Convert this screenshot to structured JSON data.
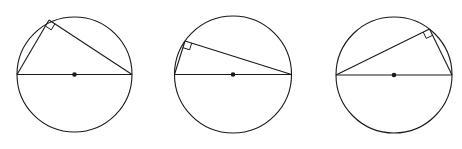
{
  "diagram": {
    "title": "",
    "stroke_color": "#1a1a1a",
    "background": "#ffffff",
    "figures": [
      {
        "id": "figure-1",
        "center": [
          74.5,
          74.5
        ],
        "radius": 57.5,
        "diameter_endpoints": [
          [
            17,
            74.5
          ],
          [
            132,
            74.5
          ]
        ],
        "right_angle_vertex": [
          49,
          20
        ],
        "right_angle_marker": true
      },
      {
        "id": "figure-2",
        "center": [
          233,
          74.5
        ],
        "radius": 58.5,
        "diameter_endpoints": [
          [
            174.5,
            74.5
          ],
          [
            291.5,
            74.5
          ]
        ],
        "right_angle_vertex": [
          185,
          41
        ],
        "right_angle_marker": true
      },
      {
        "id": "figure-3",
        "center": [
          394,
          75
        ],
        "radius": 58,
        "diameter_endpoints": [
          [
            336,
            75
          ],
          [
            452,
            75
          ]
        ],
        "right_angle_vertex": [
          429.5,
          29
        ],
        "right_angle_marker": true
      }
    ]
  }
}
